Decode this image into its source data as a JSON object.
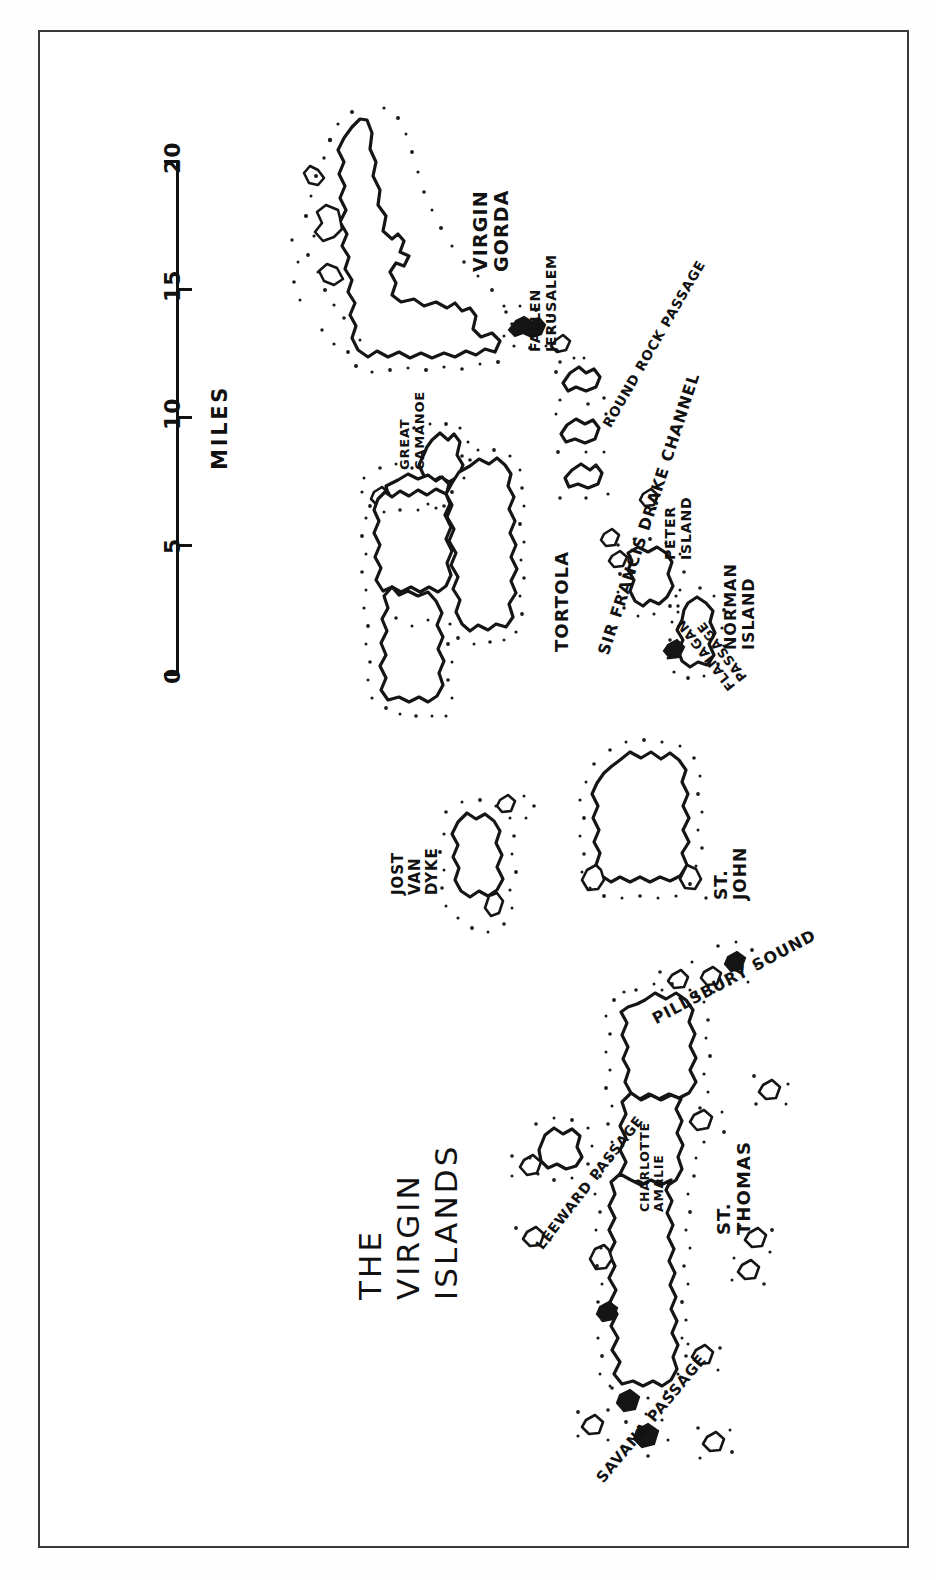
{
  "document": {
    "kind": "hand-drawn pen-and-ink map",
    "title_lines": [
      "THE",
      "VIRGIN",
      "ISLANDS"
    ],
    "background_color": "#ffffff",
    "ink_color": "#111111",
    "frame_color": "#3a3a3a"
  },
  "scale": {
    "units_label": "MILES",
    "tick_labels": [
      "20",
      "15",
      "10",
      "5",
      "0"
    ],
    "min": 0,
    "max": 20,
    "interval": 5
  },
  "labels": {
    "virgin_gorda": "VIRGIN\nGORDA",
    "virgin_gorda_lines": [
      "VIRGIN",
      "GORDA"
    ],
    "fallen_jerusalem_lines": [
      "FALLEN",
      "JERUSALEM"
    ],
    "round_rock_passage": "ROUND ROCK PASSAGE",
    "great_camanoe_lines": [
      "GREAT",
      "CAMANOE"
    ],
    "tortola": "TORTOLA",
    "sir_francis_drake_channel": "SIR FRANCIS DRAKE CHANNEL",
    "peter_island_lines": [
      "PETER",
      "ISLAND"
    ],
    "norman_island_lines": [
      "NORMAN",
      "ISLAND"
    ],
    "flanagan_passage_lines": [
      "FLANAGAN",
      "PASSAGE"
    ],
    "jost_van_dyke_lines": [
      "JOST",
      "VAN",
      "DYKE"
    ],
    "st_john_lines": [
      "ST.",
      "JOHN"
    ],
    "pillsbury_sound": "PILLSBURY SOUND",
    "leeward_passage": "LEEWARD PASSAGE",
    "charlotte_amalie_lines": [
      "CHARLOTTE",
      "AMALIE"
    ],
    "st_thomas_lines": [
      "ST.",
      "THOMAS"
    ],
    "savana_passage": "SAVANA PASSAGE"
  },
  "features": {
    "islands": [
      "Virgin Gorda",
      "Fallen Jerusalem",
      "Great Camanoe",
      "Tortola",
      "Peter Island",
      "Norman Island",
      "Jost Van Dyke",
      "St. John",
      "St. Thomas"
    ],
    "waterways": [
      "Round Rock Passage",
      "Sir Francis Drake Channel",
      "Flanagan Passage",
      "Pillsbury Sound",
      "Leeward Passage",
      "Savana Passage"
    ],
    "settlements": [
      "Charlotte Amalie"
    ]
  }
}
